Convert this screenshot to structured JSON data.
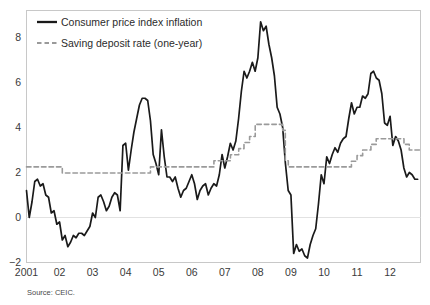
{
  "chart_data": {
    "type": "line",
    "title": "",
    "subtitle": "",
    "xlabel": "",
    "ylabel": "",
    "source": "Source: CEIC.",
    "grid": false,
    "zero_line": true,
    "legend_position": "top-left",
    "xlim": [
      2001.0,
      2012.92
    ],
    "ylim": [
      -2,
      9.2
    ],
    "yticks": [
      -2,
      0,
      2,
      4,
      6,
      8
    ],
    "ytick_labels": [
      "-2",
      "0",
      "2",
      "4",
      "6",
      "8"
    ],
    "xticks": [
      2001,
      2002,
      2003,
      2004,
      2005,
      2006,
      2007,
      2008,
      2009,
      2010,
      2011,
      2012
    ],
    "xtick_labels": [
      "2001",
      "02",
      "03",
      "04",
      "05",
      "06",
      "07",
      "08",
      "09",
      "10",
      "11",
      "12"
    ],
    "series": [
      {
        "name": "Consumer price index inflation",
        "style": "solid",
        "color": "#1a1a1a",
        "width": 1.7,
        "x": [
          2001.0,
          2001.083,
          2001.167,
          2001.25,
          2001.333,
          2001.417,
          2001.5,
          2001.583,
          2001.667,
          2001.75,
          2001.833,
          2001.917,
          2002.0,
          2002.083,
          2002.167,
          2002.25,
          2002.333,
          2002.417,
          2002.5,
          2002.583,
          2002.667,
          2002.75,
          2002.833,
          2002.917,
          2003.0,
          2003.083,
          2003.167,
          2003.25,
          2003.333,
          2003.417,
          2003.5,
          2003.583,
          2003.667,
          2003.75,
          2003.833,
          2003.917,
          2004.0,
          2004.083,
          2004.167,
          2004.25,
          2004.333,
          2004.417,
          2004.5,
          2004.583,
          2004.667,
          2004.75,
          2004.833,
          2004.917,
          2005.0,
          2005.083,
          2005.167,
          2005.25,
          2005.333,
          2005.417,
          2005.5,
          2005.583,
          2005.667,
          2005.75,
          2005.833,
          2005.917,
          2006.0,
          2006.083,
          2006.167,
          2006.25,
          2006.333,
          2006.417,
          2006.5,
          2006.583,
          2006.667,
          2006.75,
          2006.833,
          2006.917,
          2007.0,
          2007.083,
          2007.167,
          2007.25,
          2007.333,
          2007.417,
          2007.5,
          2007.583,
          2007.667,
          2007.75,
          2007.833,
          2007.917,
          2008.0,
          2008.083,
          2008.167,
          2008.25,
          2008.333,
          2008.417,
          2008.5,
          2008.583,
          2008.667,
          2008.75,
          2008.833,
          2008.917,
          2009.0,
          2009.083,
          2009.167,
          2009.25,
          2009.333,
          2009.417,
          2009.5,
          2009.583,
          2009.667,
          2009.75,
          2009.833,
          2009.917,
          2010.0,
          2010.083,
          2010.167,
          2010.25,
          2010.333,
          2010.417,
          2010.5,
          2010.583,
          2010.667,
          2010.75,
          2010.833,
          2010.917,
          2011.0,
          2011.083,
          2011.167,
          2011.25,
          2011.333,
          2011.417,
          2011.5,
          2011.583,
          2011.667,
          2011.75,
          2011.833,
          2011.917,
          2012.0,
          2012.083,
          2012.167,
          2012.25,
          2012.333,
          2012.417,
          2012.5,
          2012.583,
          2012.667,
          2012.75,
          2012.833
        ],
        "values": [
          1.2,
          0.0,
          0.7,
          1.6,
          1.7,
          1.4,
          1.5,
          1.0,
          0.9,
          0.2,
          0.3,
          -0.3,
          -0.2,
          -1.0,
          -0.8,
          -1.3,
          -1.1,
          -0.8,
          -0.9,
          -0.7,
          -0.7,
          -0.8,
          -0.6,
          -0.4,
          0.2,
          0.0,
          0.9,
          1.0,
          0.7,
          0.3,
          0.5,
          0.9,
          1.1,
          1.0,
          0.3,
          3.2,
          3.3,
          2.1,
          3.0,
          3.8,
          4.4,
          5.0,
          5.3,
          5.3,
          5.2,
          4.3,
          2.8,
          2.4,
          1.9,
          3.9,
          2.7,
          1.8,
          1.8,
          1.6,
          1.8,
          1.3,
          0.9,
          1.2,
          1.3,
          1.6,
          1.9,
          1.5,
          0.8,
          1.2,
          1.4,
          1.5,
          1.0,
          1.3,
          1.5,
          1.4,
          1.9,
          2.8,
          2.2,
          2.7,
          3.3,
          3.0,
          3.4,
          4.4,
          5.6,
          6.5,
          6.2,
          6.5,
          6.9,
          6.5,
          7.1,
          8.7,
          8.3,
          8.5,
          7.7,
          7.1,
          6.3,
          4.9,
          4.6,
          4.0,
          2.4,
          1.2,
          1.0,
          -1.6,
          -1.2,
          -1.5,
          -1.4,
          -1.7,
          -1.8,
          -1.2,
          -0.8,
          -0.5,
          0.6,
          1.9,
          1.5,
          2.7,
          2.4,
          2.8,
          3.1,
          2.9,
          3.3,
          3.5,
          3.6,
          4.4,
          5.1,
          4.6,
          4.9,
          4.9,
          5.4,
          5.3,
          5.5,
          6.4,
          6.5,
          6.2,
          6.1,
          5.5,
          4.2,
          4.1,
          4.5,
          3.2,
          3.6,
          3.4,
          3.0,
          2.2,
          1.8,
          2.0,
          1.9,
          1.7,
          1.7
        ]
      },
      {
        "name": "Saving deposit rate (one-year)",
        "style": "dashed",
        "color": "#9a9a9a",
        "width": 1.6,
        "x": [
          2001.0,
          2002.083,
          2002.083,
          2004.75,
          2004.75,
          2006.67,
          2006.67,
          2007.17,
          2007.17,
          2007.42,
          2007.42,
          2007.58,
          2007.58,
          2007.75,
          2007.75,
          2007.92,
          2007.92,
          2008.75,
          2008.75,
          2008.83,
          2008.83,
          2008.92,
          2008.92,
          2010.83,
          2010.83,
          2011.0,
          2011.0,
          2011.17,
          2011.17,
          2011.42,
          2011.42,
          2011.58,
          2011.58,
          2012.42,
          2012.42,
          2012.58,
          2012.58,
          2012.92
        ],
        "values": [
          2.25,
          2.25,
          1.98,
          1.98,
          2.25,
          2.25,
          2.52,
          2.52,
          2.79,
          2.79,
          3.06,
          3.06,
          3.33,
          3.33,
          3.6,
          3.6,
          4.14,
          4.14,
          3.87,
          3.87,
          2.52,
          2.52,
          2.25,
          2.25,
          2.5,
          2.5,
          2.75,
          2.75,
          3.0,
          3.0,
          3.25,
          3.25,
          3.5,
          3.5,
          3.25,
          3.25,
          3.0,
          3.0
        ]
      }
    ]
  },
  "legend": {
    "items": [
      {
        "label": "Consumer price index inflation",
        "style": "solid",
        "color": "#1a1a1a"
      },
      {
        "label": "Saving deposit rate (one-year)",
        "style": "dashed",
        "color": "#9a9a9a"
      }
    ]
  },
  "footer": {
    "source": "Source: CEIC."
  },
  "colors": {
    "cpi_line": "#1a1a1a",
    "deposit_line": "#9a9a9a",
    "frame": "#c8c8c8",
    "zero_line": "#e2e2e2",
    "text": "#3a3a3a",
    "background": "#ffffff"
  }
}
